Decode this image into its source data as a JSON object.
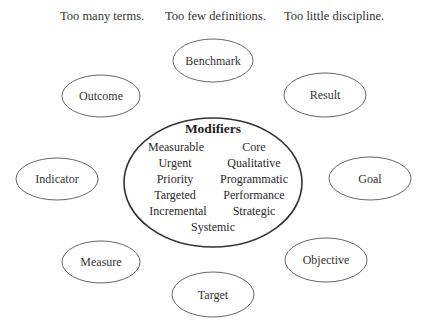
{
  "headlines": [
    {
      "text": "Too many terms."
    },
    {
      "text": "Too few definitions."
    },
    {
      "text": "Too little discipline."
    }
  ],
  "center": {
    "title": "Modifiers",
    "modifiers": [
      "Measurable",
      "Core",
      "Urgent",
      "Qualitative",
      "Priority",
      "Programmatic",
      "Targeted",
      "Performance",
      "Incremental",
      "Strategic",
      "Systemic"
    ]
  },
  "nodes": [
    {
      "id": "benchmark",
      "label": "Benchmark"
    },
    {
      "id": "outcome",
      "label": "Outcome"
    },
    {
      "id": "result",
      "label": "Result"
    },
    {
      "id": "indicator",
      "label": "Indicator"
    },
    {
      "id": "goal",
      "label": "Goal"
    },
    {
      "id": "measure",
      "label": "Measure"
    },
    {
      "id": "objective",
      "label": "Objective"
    },
    {
      "id": "target",
      "label": "Target"
    }
  ],
  "colors": {
    "stroke": "#555555",
    "center_stroke": "#333333",
    "text": "#333333",
    "background": "#ffffff"
  }
}
